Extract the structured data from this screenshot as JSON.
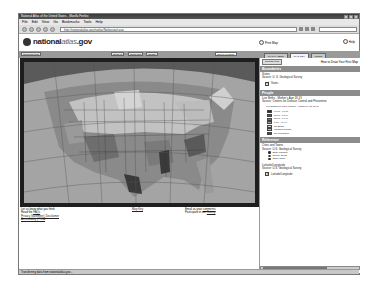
{
  "window": {
    "title": "National Atlas of the United States - Mozilla Firefox"
  },
  "menu": [
    "File",
    "Edit",
    "View",
    "Go",
    "Bookmarks",
    "Tools",
    "Help"
  ],
  "nav": {
    "url": "http://nationalatlas.gov/natlas/Natlasstart.asp",
    "search_placeholder": ""
  },
  "header": {
    "logo_text_a": "national",
    "logo_text_b": "atlas",
    "logo_text_c": ".gov",
    "print_label": "Print Map",
    "help_label": "Help"
  },
  "map_toolbar": {
    "left_button": "Overview Map",
    "zoom_in": "Zoom In",
    "zoom_out": "Zoom Out",
    "identify": "Identify",
    "select_value": "Select a feature"
  },
  "tabs": [
    {
      "label": "MAP LAYERS",
      "active": false
    },
    {
      "label": "MAP KEY",
      "active": true
    },
    {
      "label": "PRINT",
      "active": false
    }
  ],
  "panel": {
    "redraw_button": "Redraw Map",
    "howto_label": "How to Draw Your First Map",
    "sections": {
      "boundaries": {
        "title": "Boundaries",
        "layer_name": "States",
        "source": "Source: U. S. Geological Survey",
        "check_label": "States"
      },
      "people": {
        "title": "People",
        "layer_name": "Live Births - Mother's Age 18-19",
        "source": "Source: Centers for Disease Control and Prevention",
        "legend_title": "Live Births per 1000 Women - Mother's Age 18-19",
        "legend": [
          {
            "label": "96.00 - 97.00",
            "color": "#2b2b2b"
          },
          {
            "label": "75.00 - 95.99",
            "color": "#555555"
          },
          {
            "label": "50.00 - 74.99",
            "color": "#7a7a7a"
          },
          {
            "label": "0.00 - 49.99",
            "color": "#a5a5a5"
          },
          {
            "label": "No Births",
            "color": "#d8d8d8"
          },
          {
            "label": "Insufficient Data",
            "color": "#bdbdbd"
          },
          {
            "label": "No Population",
            "color": "#4a4a4a"
          }
        ]
      },
      "reference": {
        "title": "Reference",
        "cities_name": "Cities and Towns",
        "cities_source": "Source: U.S. Geological Survey",
        "cities_items": [
          "State Capitals",
          "County Seats",
          "Other Cities"
        ],
        "latlon_name": "Latitude/Longitude",
        "latlon_source": "Source: U.S. Geological Survey",
        "latlon_check": "Latitude/Longitude"
      }
    }
  },
  "footer": {
    "col1_line1": "Let us know what you think",
    "col1_line2_prefix": "Read the ",
    "col1_line2_link": "FAQs",
    "col1_line3": "Privacy Statement | Disclaimer",
    "col1_line4": "Accessibility | FOIA",
    "col2_link": "Map Key",
    "col3_line1_prefix": "Email us your ",
    "col3_line1_link": "comments",
    "col3_line2_prefix": "Participate in our ",
    "col3_line2_link": "Survey"
  },
  "status": {
    "text": "Transferring data from nationalatlas.gov..."
  }
}
